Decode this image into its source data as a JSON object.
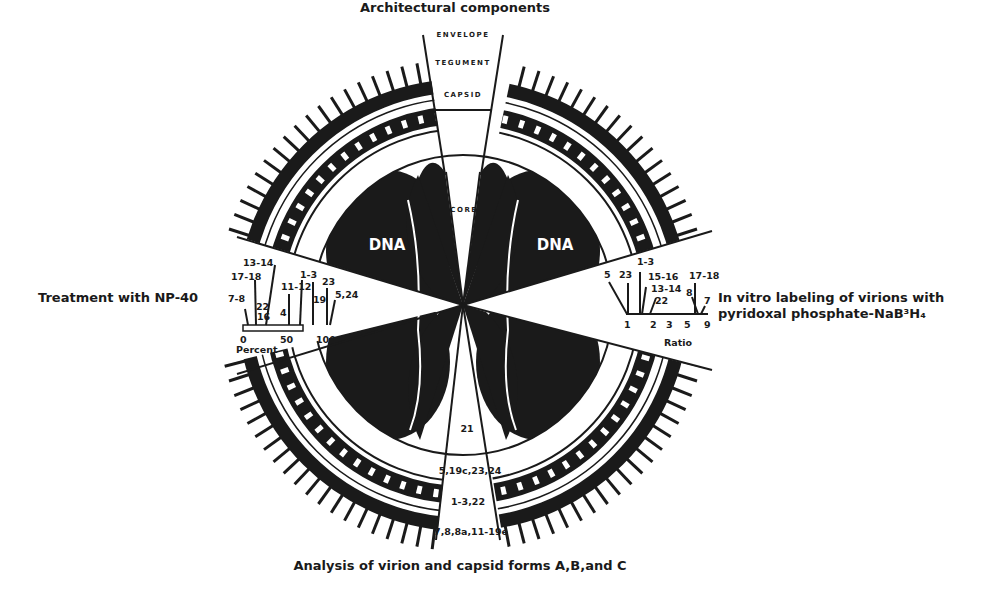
{
  "figure": {
    "title_top": "Architectural components",
    "title_left": "Treatment with NP-40",
    "title_right_line1": "In vitro labeling of virions with",
    "title_right_line2": "pyridoxal phosphate-NaB³H₄",
    "title_bottom": "Analysis of virion and capsid forms A,B,and C"
  },
  "architecture": {
    "envelope": "ENVELOPE",
    "tegument": "TEGUMENT",
    "capsid": "CAPSID",
    "core": "CORE",
    "dna_left": "DNA",
    "dna_right": "DNA"
  },
  "np40_scale": {
    "axis_label": "Percent",
    "ticks": [
      "0",
      "50",
      "100"
    ],
    "labels": {
      "l13_14": "13-14",
      "l17_18": "17-18",
      "l7_8": "7-8",
      "l22": "22",
      "l16": "16",
      "l4": "4",
      "l11_12": "11-12",
      "l1_3": "1-3",
      "l19": "19",
      "l23": "23",
      "l5_24": "5,24"
    }
  },
  "labeling_scale": {
    "axis_label": "Ratio",
    "ticks": [
      "1",
      "2",
      "3",
      "5",
      "9"
    ],
    "labels": {
      "l1_3": "1-3",
      "l5": "5",
      "l23": "23",
      "l15_16": "15-16",
      "l13_14": "13-14",
      "l22": "22",
      "l17_18": "17-18",
      "l8": "8",
      "l7": "7"
    }
  },
  "capsid_forms": {
    "row1": "21",
    "row2": "5,19c,23,24",
    "row3": "1-3,22",
    "row4": "7,8,8a,11-19e"
  },
  "colors": {
    "ink": "#1a1a1a",
    "paper": "#ffffff"
  }
}
